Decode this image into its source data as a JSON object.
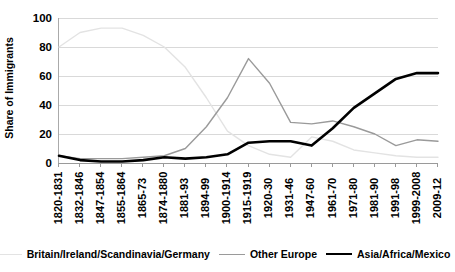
{
  "chart_data": {
    "type": "line",
    "title": "",
    "xlabel": "",
    "ylabel": "Share of Immigrants",
    "ylim": [
      0,
      100
    ],
    "yticks": [
      0,
      20,
      40,
      60,
      80,
      100
    ],
    "grid": true,
    "legend_position": "bottom",
    "categories": [
      "1820-1831",
      "1832-1846",
      "1847-1854",
      "1855-1864",
      "1865-73",
      "1874-1880",
      "1881-93",
      "1894-99",
      "1900-1914",
      "1915-1919",
      "1920-30",
      "1931-46",
      "1947-60",
      "1961-70",
      "1971-80",
      "1981-90",
      "1991-98",
      "1999-2008",
      "2009-12"
    ],
    "series": [
      {
        "name": "Britain/Ireland/Scandinavia/Germany",
        "color": "#e3e3e3",
        "width": 1.4,
        "values": [
          80,
          90,
          93,
          93,
          88,
          80,
          66,
          45,
          22,
          12,
          6,
          4,
          18,
          15,
          9,
          7,
          5,
          4,
          4
        ]
      },
      {
        "name": "Other Europe",
        "color": "#9a9a9a",
        "width": 1.4,
        "values": [
          5,
          3,
          3,
          3,
          4,
          5,
          10,
          25,
          45,
          72,
          55,
          28,
          27,
          29,
          25,
          20,
          12,
          16,
          15
        ]
      },
      {
        "name": "Asia/Africa/Mexico",
        "color": "#000000",
        "width": 2.6,
        "values": [
          5,
          2,
          1,
          1,
          2,
          4,
          3,
          4,
          6,
          14,
          15,
          15,
          12,
          24,
          38,
          48,
          58,
          62,
          62
        ]
      }
    ]
  },
  "axis": {
    "y_title": "Share of Immigrants"
  }
}
